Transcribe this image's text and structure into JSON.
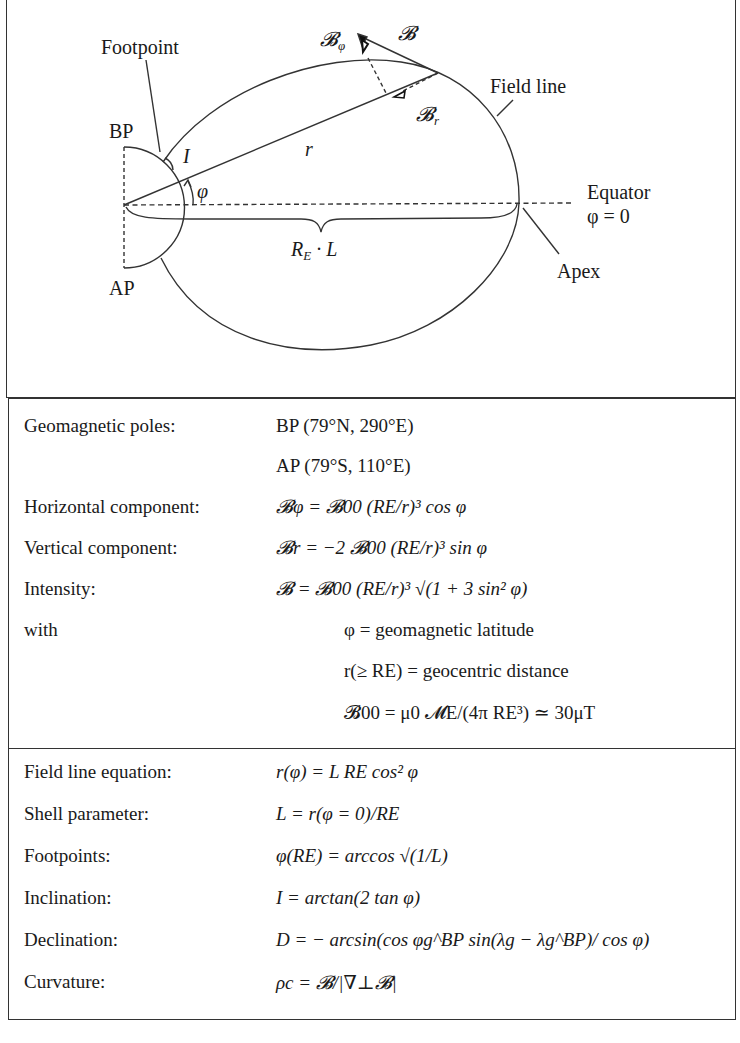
{
  "figure": {
    "labels": {
      "footpoint": "Footpoint",
      "bp": "BP",
      "ap": "AP",
      "inclination": "I",
      "r": "r",
      "phi": "φ",
      "b_phi": "𝓑",
      "b_phi_sub": "φ",
      "b": "𝓑",
      "b_r": "𝓑",
      "b_r_sub": "r",
      "field_line": "Field line",
      "equator": "Equator",
      "equator_eq": "φ = 0",
      "apex": "Apex",
      "re_l": "R",
      "re_l_sub": "E",
      "re_l_rest": " · L"
    },
    "colors": {
      "stroke": "#333333",
      "text": "#1a1a1a",
      "background": "#ffffff"
    }
  },
  "table": {
    "section1": [
      {
        "key": "Geomagnetic poles:",
        "value": "BP    (79°N, 290°E)"
      },
      {
        "key": "",
        "value": "AP    (79°S, 110°E)"
      },
      {
        "key": "Horizontal component:",
        "value": "𝓑φ = 𝓑00  (RE/r)³  cos φ"
      },
      {
        "key": "Vertical component:",
        "value": "𝓑r = −2 𝓑00  (RE/r)³ sin φ"
      },
      {
        "key": "Intensity:",
        "value": "𝓑 = 𝓑00  (RE/r)³ √(1 + 3 sin² φ)"
      },
      {
        "key": "with",
        "value": "φ = geomagnetic latitude"
      },
      {
        "key": "",
        "value": "r(≥ RE) = geocentric distance"
      },
      {
        "key": "",
        "value": "𝓑00 = μ0 𝓜E/(4π RE³) ≃ 30μT"
      }
    ],
    "section2": [
      {
        "key": "Field line equation:",
        "value": "r(φ) = L RE  cos² φ"
      },
      {
        "key": "Shell parameter:",
        "value": "L = r(φ = 0)/RE"
      },
      {
        "key": "Footpoints:",
        "value": "φ(RE) = arccos √(1/L)"
      },
      {
        "key": "Inclination:",
        "value": "I = arctan(2 tan φ)"
      },
      {
        "key": "Declination:",
        "value": "D = − arcsin(cos φg^BP  sin(λg − λg^BP)/ cos φ)"
      },
      {
        "key": "Curvature:",
        "value": "ρc = 𝓑/|∇⊥𝓑|"
      }
    ]
  }
}
